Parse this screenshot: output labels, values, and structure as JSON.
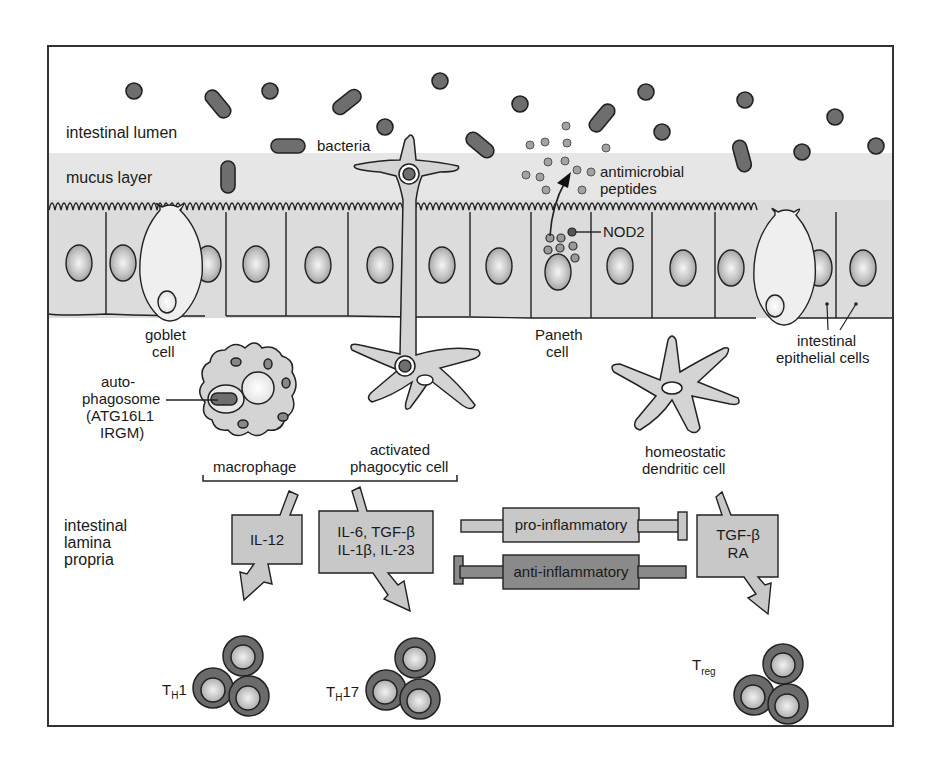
{
  "diagram": {
    "title": "",
    "regions": {
      "lumen": "intestinal lumen",
      "mucus": "mucus layer",
      "lamina_propria": [
        "intestinal",
        "lamina",
        "propria"
      ]
    },
    "labels": {
      "bacteria": "bacteria",
      "antimicrobial_peptides": [
        "antimicrobial",
        "peptides"
      ],
      "nod2": "NOD2",
      "goblet_cell": [
        "goblet",
        "cell"
      ],
      "paneth_cell": [
        "Paneth",
        "cell"
      ],
      "intestinal_epithelial_cells": [
        "intestinal",
        "epithelial cells"
      ],
      "autophagosome": [
        "auto-",
        "phagosome",
        "(ATG16L1",
        "IRGM)"
      ],
      "macrophage": "macrophage",
      "activated_phagocytic_cell": [
        "activated",
        "phagocytic cell"
      ],
      "homeostatic_dendritic_cell": [
        "homeostatic",
        "dendritic cell"
      ]
    },
    "cytokine_boxes": [
      {
        "id": "il12",
        "lines": [
          "IL-12"
        ]
      },
      {
        "id": "th17-cytokines",
        "lines": [
          "IL-6, TGF-β",
          "IL-1β, IL-23"
        ]
      },
      {
        "id": "treg-cytokines",
        "lines": [
          "TGF-β",
          "RA"
        ]
      }
    ],
    "balance": {
      "pro": "pro-inflammatory",
      "anti": "anti-inflammatory"
    },
    "t_cells": [
      {
        "main": "T",
        "sub": "H",
        "suffix": "1"
      },
      {
        "main": "T",
        "sub": "H",
        "suffix": "17"
      },
      {
        "main": "T",
        "sub": "reg",
        "suffix": ""
      }
    ],
    "colors": {
      "frame": "#333333",
      "mucus": "#e6e6e6",
      "epithelium": "#dcdcdc",
      "cell_fill": "#d4d4d4",
      "bacteria": "#6e6e6e",
      "peptide": "#9a9a9a",
      "box_light": "#c8c8c8",
      "box_dark": "#8a8a8a",
      "tcell_outer": "#6b6b6b",
      "tcell_inner": "#d0d0d0"
    }
  }
}
